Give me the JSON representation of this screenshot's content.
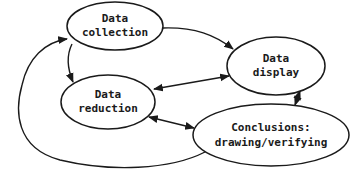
{
  "diagram": {
    "type": "cyclic flow diagram",
    "colors": {
      "stroke": "#1a1a1a",
      "background": "#ffffff",
      "text": "#1a1a1a"
    },
    "nodes": [
      {
        "id": "data-collection",
        "line1": "Data",
        "line2": "collection"
      },
      {
        "id": "data-display",
        "line1": "Data",
        "line2": "display"
      },
      {
        "id": "data-reduction",
        "line1": "Data",
        "line2": "reduction"
      },
      {
        "id": "conclusions",
        "line1": "Conclusions:",
        "line2": "drawing/verifying"
      }
    ],
    "edges": [
      {
        "from": "data-collection",
        "to": "data-display",
        "direction": "one-way"
      },
      {
        "from": "data-collection",
        "to": "data-reduction",
        "direction": "one-way"
      },
      {
        "from": "data-reduction",
        "to": "data-display",
        "direction": "two-way"
      },
      {
        "from": "data-reduction",
        "to": "conclusions",
        "direction": "two-way"
      },
      {
        "from": "data-display",
        "to": "conclusions",
        "direction": "two-way"
      },
      {
        "from": "conclusions",
        "to": "data-collection",
        "direction": "one-way"
      }
    ]
  }
}
